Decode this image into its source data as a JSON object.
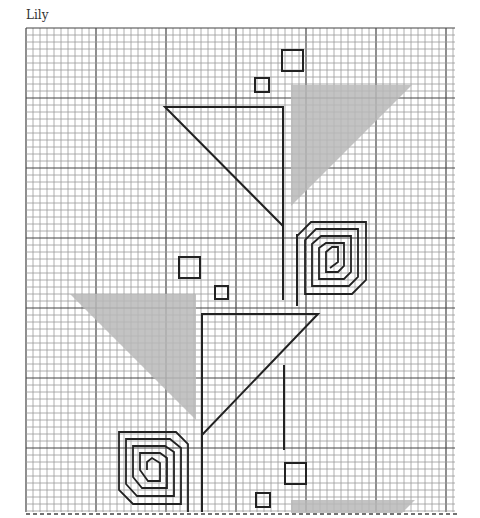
{
  "title": "Lily",
  "colors": {
    "grid_minor": "#9a9a9a",
    "grid_major": "#444444",
    "shape_stroke": "#222222",
    "shade_fill": "#b8b8b8",
    "background": "#ffffff"
  },
  "grid": {
    "x0": 26,
    "y0": 28,
    "x1": 455,
    "y1": 512,
    "cell": 7.0,
    "major_every": 10
  },
  "shapes": {
    "outline_triangles": [
      {
        "name": "upper-flower-triangle",
        "points": "165,107 283,107 283,226"
      },
      {
        "name": "lower-flower-triangle",
        "points": "202,314 318,314 202,435"
      }
    ],
    "shaded_triangles": [
      {
        "name": "upper-leaf-shade",
        "points": "291,85 412,85 291,206"
      },
      {
        "name": "middle-leaf-shade",
        "points": "70,294 196,294 196,420"
      },
      {
        "name": "bottom-shade",
        "points": "291,500 415,500 402,513 291,513"
      }
    ],
    "squares": [
      {
        "name": "top-large-square",
        "x": 282,
        "y": 50,
        "size": 21
      },
      {
        "name": "top-small-square",
        "x": 255,
        "y": 78,
        "size": 14
      },
      {
        "name": "middle-large-square",
        "x": 179,
        "y": 257,
        "size": 21
      },
      {
        "name": "middle-small-square",
        "x": 215,
        "y": 286,
        "size": 13
      },
      {
        "name": "bottom-large-square",
        "x": 285,
        "y": 463,
        "size": 21
      },
      {
        "name": "bottom-small-square",
        "x": 256,
        "y": 493,
        "size": 14
      }
    ],
    "stems": [
      {
        "name": "upper-stem",
        "x1": 283,
        "y1": 226,
        "x2": 283,
        "y2": 300
      },
      {
        "name": "upper-spiral-stem",
        "x1": 297,
        "y1": 234,
        "x2": 297,
        "y2": 306
      },
      {
        "name": "lower-stem",
        "x1": 202,
        "y1": 435,
        "x2": 202,
        "y2": 512
      },
      {
        "name": "right-stem",
        "x1": 284,
        "y1": 365,
        "x2": 284,
        "y2": 450
      }
    ],
    "spirals": [
      {
        "name": "upper-spiral",
        "points": "297,306 297,236 311,222 366,222 366,280 352,294 305,294 305,240 316,229 358,229 358,277 349,286 312,286 312,244 321,236 351,236 351,272 344,279 319,279 319,248 326,243 344,243 344,266 338,272 326,272 326,252 332,247 338,247 338,262 330,268"
      },
      {
        "name": "lower-spiral",
        "points": "188,512 188,444 176,432 119,432 119,490 133,504 181,504 181,448 170,439 126,439 126,484 137,496 174,496 174,452 165,446 133,446 133,477 142,488 167,488 167,458 160,453 140,453 140,470 148,481 160,481 160,463 152,458 147,462 147,470"
      }
    ]
  }
}
